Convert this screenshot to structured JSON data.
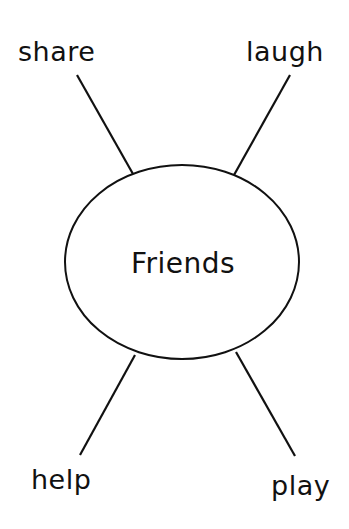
{
  "diagram": {
    "type": "word-web",
    "center": {
      "label": "Friends"
    },
    "branches": [
      {
        "position": "top-left",
        "label": "share"
      },
      {
        "position": "top-right",
        "label": "laugh"
      },
      {
        "position": "bottom-left",
        "label": "help"
      },
      {
        "position": "bottom-right",
        "label": "play"
      }
    ],
    "colors": {
      "ink": "#111111",
      "background": "#ffffff"
    }
  }
}
